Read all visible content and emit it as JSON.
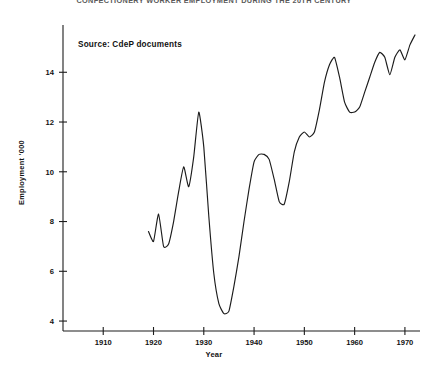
{
  "chart_data": {
    "type": "line",
    "title": "CONFECTIONERY WORKER EMPLOYMENT DURING THE 20TH CENTURY",
    "subtitle": "",
    "xlabel": "Year",
    "ylabel": "Employment  '000",
    "xlim": [
      1902,
      1973
    ],
    "ylim": [
      3.6,
      15.9
    ],
    "xticks": [
      1910,
      1920,
      1930,
      1940,
      1950,
      1960,
      1970
    ],
    "xtick_labels": [
      "1910",
      "1920",
      "1930",
      "1940",
      "1950",
      "1960",
      "1970"
    ],
    "yticks": [
      4,
      6,
      8,
      10,
      12,
      14
    ],
    "ytick_labels": [
      "4",
      "6",
      "8",
      "10",
      "12",
      "14"
    ],
    "grid": false,
    "legend": false,
    "line_color": "#1c1c1c",
    "annotations": [
      {
        "text": "Source: CdeP documents",
        "x_px": 78,
        "y_px": 40
      }
    ],
    "series": [
      {
        "name": "Employment '000",
        "x": [
          1919,
          1920,
          1921,
          1922,
          1923,
          1924,
          1925,
          1926,
          1927,
          1928,
          1929,
          1930,
          1931,
          1932,
          1933,
          1934,
          1935,
          1936,
          1937,
          1938,
          1939,
          1940,
          1941,
          1942,
          1943,
          1944,
          1945,
          1946,
          1947,
          1948,
          1949,
          1950,
          1951,
          1952,
          1953,
          1954,
          1955,
          1956,
          1957,
          1958,
          1959,
          1960,
          1961,
          1962,
          1963,
          1964,
          1965,
          1966,
          1967,
          1968,
          1969,
          1970,
          1971,
          1972
        ],
        "values": [
          7.6,
          7.2,
          8.3,
          7.0,
          7.1,
          8.0,
          9.2,
          10.2,
          9.4,
          10.6,
          12.4,
          11.0,
          8.2,
          5.9,
          4.7,
          4.3,
          4.4,
          5.4,
          6.6,
          8.0,
          9.3,
          10.4,
          10.7,
          10.7,
          10.5,
          9.7,
          8.8,
          8.7,
          9.6,
          10.8,
          11.4,
          11.6,
          11.4,
          11.6,
          12.5,
          13.6,
          14.3,
          14.6,
          13.8,
          12.8,
          12.4,
          12.4,
          12.6,
          13.2,
          13.8,
          14.4,
          14.8,
          14.6,
          13.9,
          14.6,
          14.9,
          14.5,
          15.1,
          15.5
        ]
      }
    ]
  },
  "axes": {
    "y_axis_label": "Employment  '000",
    "x_axis_label": "Year"
  }
}
